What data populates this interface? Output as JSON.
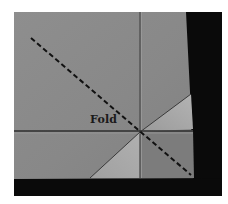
{
  "image": {
    "description": "Grayscale photograph of a folded fabric corner with a diagonal dashed fold line",
    "label": "Fold",
    "colors": {
      "fabric": "#8a8a8a",
      "fabric_light": "#a9a9a9",
      "crease": "#3a3a3a",
      "background_dark": "#0a0a0a",
      "dash_line": "#111111",
      "label_text": "#1a1a1a"
    }
  }
}
